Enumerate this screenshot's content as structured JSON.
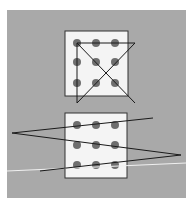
{
  "figure": {
    "colors": {
      "page_background": "#ffffff",
      "panel": "#a9a9a9",
      "box_fill": "#f4f4f4",
      "box_stroke": "#333333",
      "dot": "#6e6e6e",
      "line": "#1a1a1a",
      "highlight_line": "#f0f0f0"
    },
    "panel": {
      "x": 7,
      "y": 10,
      "w": 179,
      "h": 188
    },
    "top_puzzle": {
      "box": {
        "x": 65,
        "y": 31,
        "w": 63,
        "h": 65
      },
      "dots_x": [
        77,
        96,
        115
      ],
      "dots_y": [
        43,
        62,
        83
      ],
      "solution_path": "77,103 77,43 135,43 77,103",
      "extra_segment": "77,43 135,103"
    },
    "bottom_puzzle": {
      "box": {
        "x": 65,
        "y": 113,
        "w": 62,
        "h": 65
      },
      "dots_x": [
        77,
        96,
        115
      ],
      "dots_y": [
        125,
        145,
        165
      ],
      "solution_path": "153,118 12,133 181,155 40,171"
    },
    "white_line": "7,171 186,163"
  }
}
